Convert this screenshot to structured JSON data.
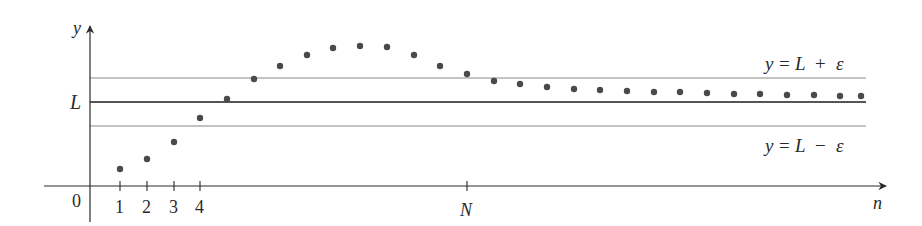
{
  "figure": {
    "axes": {
      "y_label": "y",
      "x_label": "n",
      "origin_label": "0",
      "L_label": "L",
      "N_label": "N",
      "x_ticks": [
        "1",
        "2",
        "3",
        "4"
      ]
    },
    "lines": {
      "upper_label": "y = L + ε",
      "upper_parts": {
        "y": "y",
        "eq": "=",
        "L": "L",
        "op": "+",
        "eps": "ε"
      },
      "lower_label": "y = L − ε",
      "lower_parts": {
        "y": "y",
        "eq": "=",
        "L": "L",
        "op": "−",
        "eps": "ε"
      }
    },
    "colors": {
      "axis": "#2a2a2a",
      "band_line": "#8a8a8a",
      "limit_line": "#555555",
      "dot": "#4a4a4a"
    }
  },
  "chart_data": {
    "type": "scatter",
    "title": "",
    "xlabel": "n",
    "ylabel": "y",
    "reference_lines": [
      {
        "name": "y = L + ε",
        "y": 1.25
      },
      {
        "name": "L",
        "y": 1.0
      },
      {
        "name": "y = L − ε",
        "y": 0.75
      }
    ],
    "annotations": [
      "0",
      "1",
      "2",
      "3",
      "4",
      "N",
      "L",
      "y = L + ε",
      "y = L − ε"
    ],
    "x": [
      1,
      2,
      3,
      4,
      5,
      6,
      7,
      8,
      9,
      10,
      11,
      12,
      13,
      14,
      15,
      16,
      17,
      18,
      19,
      20,
      21,
      22,
      23,
      24,
      25,
      26,
      27,
      28,
      29
    ],
    "values": [
      0.18,
      0.28,
      0.46,
      0.71,
      0.91,
      1.12,
      1.26,
      1.37,
      1.45,
      1.47,
      1.46,
      1.37,
      1.26,
      1.17,
      1.1,
      1.07,
      1.04,
      1.02,
      1.01,
      1.0,
      0.99,
      0.99,
      0.98,
      0.97,
      0.97,
      0.96,
      0.96,
      0.95,
      0.95
    ],
    "pixel_points": [
      [
        120,
        169
      ],
      [
        147,
        159
      ],
      [
        174,
        142
      ],
      [
        200,
        118
      ],
      [
        227,
        99
      ],
      [
        254,
        79
      ],
      [
        280,
        66
      ],
      [
        307,
        55
      ],
      [
        333,
        48
      ],
      [
        360,
        46
      ],
      [
        387,
        47
      ],
      [
        414,
        55
      ],
      [
        440,
        66
      ],
      [
        467,
        74
      ],
      [
        494,
        81
      ],
      [
        520,
        84
      ],
      [
        547,
        87
      ],
      [
        574,
        89
      ],
      [
        600,
        90
      ],
      [
        627,
        91
      ],
      [
        654,
        92
      ],
      [
        680,
        92
      ],
      [
        707,
        93
      ],
      [
        734,
        94
      ],
      [
        760,
        94
      ],
      [
        787,
        95
      ],
      [
        814,
        95
      ],
      [
        840,
        96
      ],
      [
        861,
        96
      ]
    ],
    "N_index": 14,
    "grid": false,
    "legend": "none"
  }
}
